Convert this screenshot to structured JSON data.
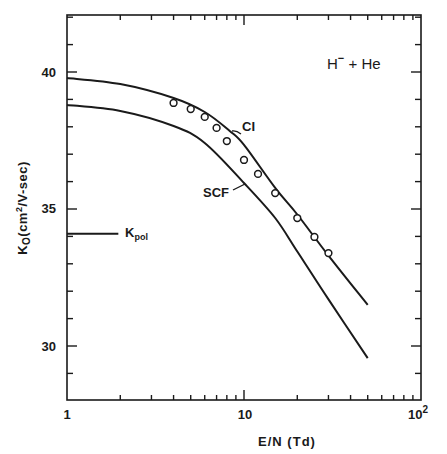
{
  "chart_data": {
    "type": "line",
    "title": "",
    "annotation": "H⁻ + He",
    "xlabel": "E/N (Td)",
    "ylabel": "K₀(cm²/V-sec)",
    "xscale": "log",
    "xlim": [
      1,
      100
    ],
    "ylim": [
      28,
      42.1
    ],
    "x_ticks": [
      1,
      10,
      100
    ],
    "x_tick_labels": [
      "1",
      "10",
      "10²"
    ],
    "y_ticks": [
      30,
      35,
      40
    ],
    "y_tick_labels": [
      "30",
      "35",
      "40"
    ],
    "y_minor_step": 1,
    "grid": false,
    "legend": "none (inline curve labels)",
    "series": [
      {
        "name": "CI",
        "kind": "line",
        "x": [
          1,
          2,
          4,
          6,
          8.3,
          10,
          15,
          20,
          30,
          50
        ],
        "y": [
          39.78,
          39.56,
          39.05,
          38.54,
          37.85,
          37.34,
          35.77,
          34.8,
          33.3,
          31.5
        ]
      },
      {
        "name": "SCF",
        "kind": "line",
        "x": [
          1,
          2,
          4,
          6,
          10,
          15,
          20,
          30,
          50
        ],
        "y": [
          38.8,
          38.58,
          38.03,
          37.41,
          35.95,
          34.67,
          33.45,
          31.7,
          29.56
        ]
      },
      {
        "name": "Experiment",
        "kind": "scatter",
        "marker": "open-circle",
        "x": [
          4,
          5,
          6,
          7,
          8,
          10,
          12,
          15,
          20,
          25,
          30
        ],
        "y": [
          38.87,
          38.65,
          38.36,
          37.96,
          37.48,
          36.79,
          36.28,
          35.58,
          34.67,
          33.98,
          33.39
        ]
      }
    ],
    "reference_lines": [
      {
        "name": "K_pol",
        "label": "Kpol",
        "y": 34.1,
        "x_from": 1,
        "x_to": 1.95
      }
    ],
    "curve_labels": [
      {
        "text": "CI",
        "x": 11.5,
        "y": 38.1
      },
      {
        "text": "SCF",
        "x": 7.0,
        "y": 36.0
      }
    ]
  },
  "labels": {
    "annotation_main": "H",
    "annotation_sup": "−",
    "annotation_rest": " + He",
    "xlabel": "E/N (Td)",
    "ylabel_k": "K",
    "ylabel_sub": "O",
    "ylabel_rest": "(cm",
    "ylabel_sup": "2",
    "ylabel_tail": "/V-sec)",
    "kpol_main": "K",
    "kpol_sub": "pol",
    "ci_label": "CI",
    "scf_label": "SCF",
    "x_tick_1": "1",
    "x_tick_10": "10",
    "x_tick_100_base": "10",
    "x_tick_100_exp": "2",
    "y_tick_30": "30",
    "y_tick_35": "35",
    "y_tick_40": "40"
  }
}
